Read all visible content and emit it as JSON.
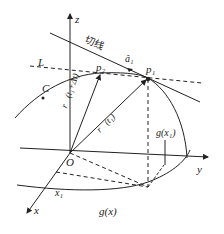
{
  "diagram": {
    "axes": {
      "z": "z",
      "y": "y",
      "x": "x",
      "origin": "O"
    },
    "labels": {
      "tangent_line": "切线",
      "unit_vector": "â₁",
      "line_L": "L",
      "curve_C": "C",
      "point_p1": "p₁",
      "point_p2": "p₂",
      "vector_t1_dt": "r⃗(t₁+Δt)",
      "vector_t1": "r⃗(t₁)",
      "x1": "x₁",
      "g_x1": "g(x₁)",
      "g_x": "g(x)"
    },
    "colors": {
      "stroke": "#222222",
      "background": "#ffffff"
    }
  }
}
